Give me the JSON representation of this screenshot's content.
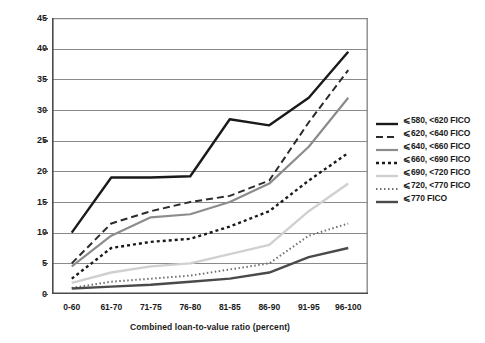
{
  "chart_data": {
    "type": "line",
    "title": "",
    "xlabel": "Combined loan-to-value ratio (percent)",
    "ylabel": "Default rate (percent)",
    "categories": [
      "0-60",
      "61-70",
      "71-75",
      "76-80",
      "81-85",
      "86-90",
      "91-95",
      "96-100"
    ],
    "ylim": [
      0,
      45
    ],
    "ytick_step": 5,
    "yticks": [
      "0",
      "5",
      "10",
      "15",
      "20",
      "25",
      "30",
      "35",
      "40",
      "45"
    ],
    "grid": "horizontal",
    "legend_position": "right",
    "series": [
      {
        "name": "⩽580, <620 FICO",
        "label": "⩽580, <620 FICO",
        "values": [
          10.0,
          19.0,
          19.0,
          19.2,
          28.5,
          27.5,
          32.0,
          39.5
        ],
        "color": "#1a1a1a",
        "width": 2.4,
        "dash": "none"
      },
      {
        "name": "⩽620, <640 FICO",
        "label": "⩽620, <640 FICO",
        "values": [
          5.0,
          11.5,
          13.5,
          15.0,
          16.0,
          18.5,
          28.0,
          36.5
        ],
        "color": "#2b2b2b",
        "width": 2.0,
        "dash": "7,4"
      },
      {
        "name": "⩽640, <660 FICO",
        "label": "⩽640, <660 FICO",
        "values": [
          4.5,
          9.5,
          12.5,
          13.0,
          15.0,
          18.0,
          24.0,
          32.0
        ],
        "color": "#8c8c8c",
        "width": 2.2,
        "dash": "none"
      },
      {
        "name": "⩽660, <690 FICO",
        "label": "⩽660, <690 FICO",
        "values": [
          2.5,
          7.5,
          8.5,
          9.0,
          11.0,
          13.5,
          18.5,
          23.0
        ],
        "color": "#1a1a1a",
        "width": 2.4,
        "dash": "3,3"
      },
      {
        "name": "⩽690, <720 FICO",
        "label": "⩽690, <720 FICO",
        "values": [
          1.8,
          3.5,
          4.5,
          5.0,
          6.5,
          8.0,
          13.5,
          18.0
        ],
        "color": "#d0d0d0",
        "width": 2.4,
        "dash": "none"
      },
      {
        "name": "⩽720, <770 FICO",
        "label": "⩽720, <770 FICO",
        "values": [
          1.0,
          2.0,
          2.5,
          3.0,
          4.0,
          5.0,
          9.5,
          11.5
        ],
        "color": "#707070",
        "width": 2.0,
        "dash": "1.5,2.5"
      },
      {
        "name": "⩽770 FICO",
        "label": "⩽770 FICO",
        "values": [
          0.9,
          1.2,
          1.5,
          2.0,
          2.5,
          3.5,
          6.0,
          7.5
        ],
        "color": "#4a4a4a",
        "width": 2.4,
        "dash": "none"
      }
    ]
  }
}
